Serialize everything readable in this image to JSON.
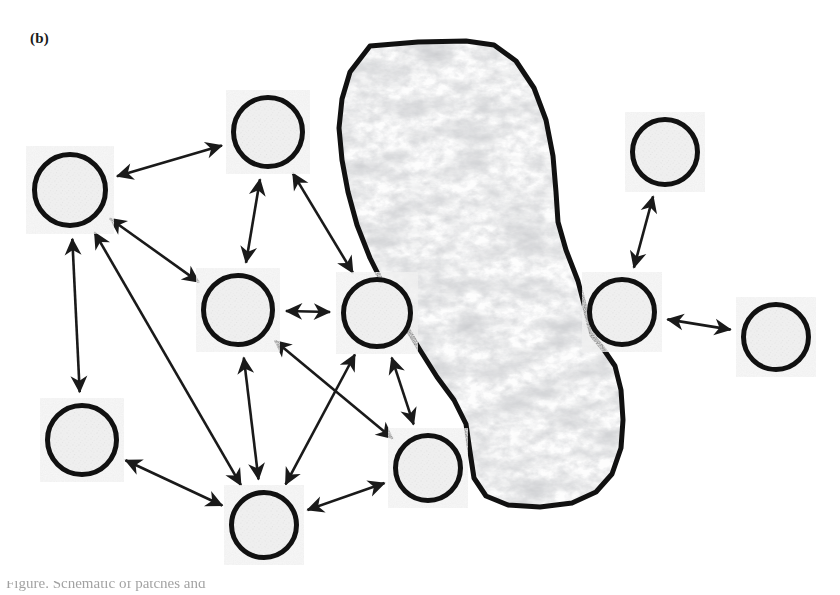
{
  "figure": {
    "panel_label": "(b)",
    "width": 840,
    "height": 595,
    "background_color": "#ffffff",
    "caption_fragment": "Figure. Schematic of patches and"
  },
  "style": {
    "node_outline_color": "#111111",
    "node_outline_width": 5,
    "node_fill_color": "#e9e9e9",
    "node_speckle_color": "#bdbdbd",
    "blob_outline_color": "#111111",
    "blob_outline_width": 5,
    "blob_fill_color": "#fdfdfd",
    "blob_vein_color": "#9a9a9a",
    "arrow_color": "#1a1a1a",
    "arrow_width": 2.6
  },
  "nodes": [
    {
      "id": "n1",
      "name": "patch-top-left",
      "cx": 70,
      "cy": 190,
      "r": 38
    },
    {
      "id": "n2",
      "name": "patch-top-middle",
      "cx": 268,
      "cy": 132,
      "r": 37
    },
    {
      "id": "n3",
      "name": "patch-center-left",
      "cx": 238,
      "cy": 310,
      "r": 37
    },
    {
      "id": "n4",
      "name": "patch-center-right",
      "cx": 377,
      "cy": 313,
      "r": 36
    },
    {
      "id": "n5",
      "name": "patch-lower-left",
      "cx": 82,
      "cy": 440,
      "r": 37
    },
    {
      "id": "n6",
      "name": "patch-bottom-center",
      "cx": 264,
      "cy": 525,
      "r": 35
    },
    {
      "id": "n7",
      "name": "patch-bottom-right",
      "cx": 428,
      "cy": 468,
      "r": 35
    },
    {
      "id": "n8",
      "name": "patch-top-right",
      "cx": 665,
      "cy": 152,
      "r": 35
    },
    {
      "id": "n9",
      "name": "patch-right-middle",
      "cx": 622,
      "cy": 312,
      "r": 35
    },
    {
      "id": "n10",
      "name": "patch-far-right",
      "cx": 776,
      "cy": 337,
      "r": 35
    }
  ],
  "blob": {
    "name": "large-habitat-blob",
    "path": "M 370 46 L 418 42 L 466 41 L 494 45 L 516 61 L 534 88 L 546 120 L 553 156 L 556 192 L 558 222 L 566 250 L 578 281 L 586 312 L 592 335 L 604 350 L 615 366 L 621 390 L 623 420 L 621 448 L 612 474 L 596 492 L 572 503 L 540 507 L 508 505 L 486 496 L 474 478 L 470 452 L 466 424 L 454 400 L 437 377 L 420 350 L 402 320 L 386 290 L 370 258 L 357 225 L 348 192 L 342 160 L 339 128 L 342 99 L 350 72 Z",
    "texture": "marble-veins"
  },
  "arrows": [
    {
      "id": "a1",
      "name": "link-n1-n2",
      "from": "n1",
      "to": "n2",
      "double": true
    },
    {
      "id": "a2",
      "name": "link-n1-n3",
      "from": "n1",
      "to": "n3",
      "double": true
    },
    {
      "id": "a3",
      "name": "link-n1-n5",
      "from": "n1",
      "to": "n5",
      "double": true
    },
    {
      "id": "a4",
      "name": "link-n1-n6",
      "from": "n1",
      "to": "n6",
      "double": true
    },
    {
      "id": "a5",
      "name": "link-n2-n3",
      "from": "n2",
      "to": "n3",
      "double": true
    },
    {
      "id": "a6",
      "name": "link-n2-n4",
      "from": "n2",
      "to": "n4",
      "double": true
    },
    {
      "id": "a7",
      "name": "link-n3-n4",
      "from": "n3",
      "to": "n4",
      "double": true
    },
    {
      "id": "a8",
      "name": "link-n3-n6",
      "from": "n3",
      "to": "n6",
      "double": true
    },
    {
      "id": "a9",
      "name": "link-n3-n7",
      "from": "n3",
      "to": "n7",
      "double": true
    },
    {
      "id": "a10",
      "name": "link-n4-n6",
      "from": "n4",
      "to": "n6",
      "double": true
    },
    {
      "id": "a11",
      "name": "link-n4-n7",
      "from": "n4",
      "to": "n7",
      "double": true
    },
    {
      "id": "a12",
      "name": "link-n5-n6",
      "from": "n5",
      "to": "n6",
      "double": true
    },
    {
      "id": "a13",
      "name": "link-n6-n7",
      "from": "n6",
      "to": "n7",
      "double": true
    },
    {
      "id": "a14",
      "name": "link-n8-n9",
      "from": "n8",
      "to": "n9",
      "double": true
    },
    {
      "id": "a15",
      "name": "link-n9-n10",
      "from": "n9",
      "to": "n10",
      "double": true
    }
  ]
}
